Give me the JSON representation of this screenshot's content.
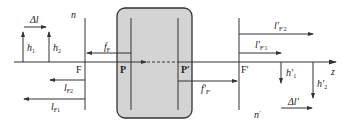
{
  "diagram": {
    "title": "",
    "colors": {
      "line": "#333333",
      "box_fill": "#d4d4d4",
      "box_stroke": "#333333",
      "background": "#ffffff"
    },
    "axis": {
      "label": "z"
    },
    "object_space": {
      "medium_label": "n",
      "focal_point_label": "F",
      "principal_plane_label": "P",
      "focal_length_label": "f",
      "focal_length_sub": "F",
      "heights": [
        {
          "label": "h",
          "sub": "1"
        },
        {
          "label": "h",
          "sub": "2"
        }
      ],
      "distances": [
        {
          "label": "l",
          "sub": "F2"
        },
        {
          "label": "l",
          "sub": "F1"
        }
      ],
      "delta_label": "Δl"
    },
    "image_space": {
      "medium_label": "n",
      "medium_prime": "′",
      "focal_point_label": "F′",
      "principal_plane_label": "P′",
      "focal_length_label": "f′",
      "focal_length_sub": "F′",
      "heights": [
        {
          "label": "h′",
          "sub": "1"
        },
        {
          "label": "h′",
          "sub": "2"
        }
      ],
      "distances": [
        {
          "label": "l′",
          "sub": "F′2"
        },
        {
          "label": "l′",
          "sub": "F′1"
        }
      ],
      "delta_label": "Δl′"
    }
  }
}
